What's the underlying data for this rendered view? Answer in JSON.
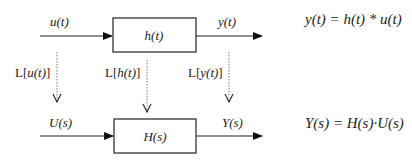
{
  "diagram": {
    "time_domain": {
      "input_label": "u(t)",
      "block_label": "h(t)",
      "output_label": "y(t)",
      "equation": "y(t) = h(t) * u(t)"
    },
    "transforms": {
      "input": {
        "prefix": "L[",
        "arg": "u(t)",
        "suffix": "]"
      },
      "block": {
        "prefix": "L[",
        "arg": "h(t)",
        "suffix": "]"
      },
      "output": {
        "prefix": "L[",
        "arg": "y(t)",
        "suffix": "]"
      }
    },
    "s_domain": {
      "input_label": "U(s)",
      "block_label": "H(s)",
      "output_label": "Y(s)",
      "equation": "Y(s) = H(s)·U(s)"
    }
  }
}
